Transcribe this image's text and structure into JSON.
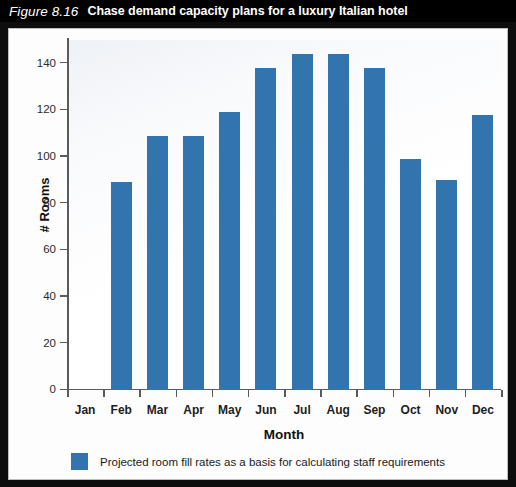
{
  "figure": {
    "number": "Figure 8.16",
    "title": "Chase demand capacity plans for a luxury Italian hotel"
  },
  "chart_data": {
    "type": "bar",
    "title": "Chase demand capacity plans for a luxury Italian hotel",
    "categories": [
      "Jan",
      "Feb",
      "Mar",
      "Apr",
      "May",
      "Jun",
      "Jul",
      "Aug",
      "Sep",
      "Oct",
      "Nov",
      "Dec"
    ],
    "values": [
      0,
      89,
      109,
      109,
      119,
      138,
      144,
      144,
      138,
      99,
      90,
      118
    ],
    "series": [
      {
        "name": "Projected room fill rates as a basis for calculating staff requirements",
        "values": [
          0,
          89,
          109,
          109,
          119,
          138,
          144,
          144,
          138,
          99,
          90,
          118
        ],
        "color": "#3275ae"
      }
    ],
    "xlabel": "Month",
    "ylabel": "# Rooms",
    "ylim": [
      0,
      150
    ],
    "yticks": [
      0,
      20,
      40,
      60,
      80,
      100,
      120,
      140
    ],
    "ytick_labels": [
      "0",
      "20",
      "40",
      "60",
      "80",
      "100",
      "120",
      "140"
    ],
    "grid": false,
    "legend_position": "bottom",
    "legend": [
      "Projected room fill rates as a basis for calculating staff requirements"
    ]
  },
  "colors": {
    "bar": "#3275ae",
    "title_bar": "#000000",
    "title_text": "#ffffff",
    "axis": "#5a5a5a",
    "panel": "#fdfdfd"
  }
}
